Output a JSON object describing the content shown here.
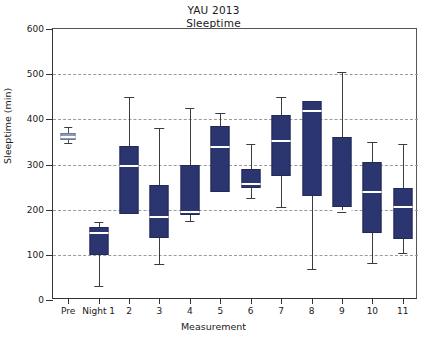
{
  "title": {
    "line1": "YAU 2013",
    "line2": "Sleeptime"
  },
  "axes": {
    "ylabel": "Sleeptime (min)",
    "xlabel": "Measurement",
    "yticks": [
      0,
      100,
      200,
      300,
      400,
      500,
      600
    ],
    "ymin": 0,
    "ymax": 600
  },
  "colors": {
    "box_fill": "#2b3570",
    "box_fill_pre": "#8e9bb5",
    "median": "#ffffff",
    "whisker": "#3b3b44",
    "grid": "#9a9a9a",
    "axis": "#333333",
    "background": "#ffffff"
  },
  "chart_data": {
    "type": "box",
    "title": "YAU 2013 Sleeptime",
    "xlabel": "Measurement",
    "ylabel": "Sleeptime (min)",
    "ylim": [
      0,
      600
    ],
    "yticks": [
      0,
      100,
      200,
      300,
      400,
      500,
      600
    ],
    "grid": true,
    "legend": "none",
    "categories": [
      "Pre",
      "Night 1",
      "2",
      "3",
      "4",
      "5",
      "6",
      "7",
      "8",
      "9",
      "10",
      "11"
    ],
    "boxes": [
      {
        "label": "Pre",
        "whisker_low": 348,
        "q1": 355,
        "median": 362,
        "q3": 370,
        "whisker_high": 382
      },
      {
        "label": "Night 1",
        "whisker_low": 31,
        "q1": 100,
        "median": 150,
        "q3": 162,
        "whisker_high": 173
      },
      {
        "label": "2",
        "whisker_low": 190,
        "q1": 190,
        "median": 300,
        "q3": 340,
        "whisker_high": 450
      },
      {
        "label": "3",
        "whisker_low": 80,
        "q1": 137,
        "median": 185,
        "q3": 255,
        "whisker_high": 380
      },
      {
        "label": "4",
        "whisker_low": 175,
        "q1": 188,
        "median": 198,
        "q3": 298,
        "whisker_high": 425
      },
      {
        "label": "5",
        "whisker_low": 238,
        "q1": 238,
        "median": 340,
        "q3": 385,
        "whisker_high": 415
      },
      {
        "label": "6",
        "whisker_low": 225,
        "q1": 248,
        "median": 258,
        "q3": 290,
        "whisker_high": 345
      },
      {
        "label": "7",
        "whisker_low": 205,
        "q1": 275,
        "median": 355,
        "q3": 410,
        "whisker_high": 450
      },
      {
        "label": "8",
        "whisker_low": 68,
        "q1": 230,
        "median": 420,
        "q3": 440,
        "whisker_high": 440
      },
      {
        "label": "9",
        "whisker_low": 195,
        "q1": 205,
        "median": 200,
        "q3": 360,
        "whisker_high": 505
      },
      {
        "label": "10",
        "whisker_low": 82,
        "q1": 148,
        "median": 242,
        "q3": 305,
        "whisker_high": 350
      },
      {
        "label": "11",
        "whisker_low": 105,
        "q1": 135,
        "median": 208,
        "q3": 248,
        "whisker_high": 345
      }
    ]
  }
}
